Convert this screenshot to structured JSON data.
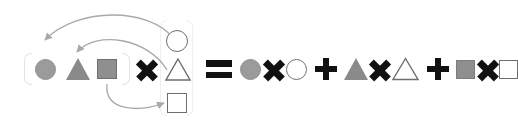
{
  "figure": {
    "background_color": "#ffffff",
    "equation_text": "( ● ▲ ■ ) × ( ○ △ □ ) = ● × ○ + ▲ × △ + ■ × □"
  },
  "palette": {
    "circle_fill": "#9b9b9b",
    "circle_stroke": "#8f8f8f",
    "triangle_fill": "#8a8a8a",
    "square_fill": "#8f8f8f",
    "square_stroke": "#6f6f6f",
    "outline_stroke": "#6e6e6e",
    "operator_black": "#111111",
    "arrow_gray": "#a9a9a9",
    "bracket_gray": "#e3e3e3"
  },
  "left_group": {
    "label": "first-factor-group",
    "bracket": "rounded-bracket",
    "items": [
      {
        "name": "filled-circle",
        "glyph": "●",
        "fill": "#9b9b9b",
        "kind": "filled"
      },
      {
        "name": "filled-triangle",
        "glyph": "▲",
        "fill": "#8a8a8a",
        "kind": "filled"
      },
      {
        "name": "filled-square",
        "glyph": "■",
        "fill": "#8f8f8f",
        "kind": "filled"
      }
    ]
  },
  "multiply_operator": {
    "name": "times",
    "glyph": "×",
    "color": "#111111"
  },
  "right_group": {
    "label": "second-factor-group",
    "bracket": "rounded-bracket",
    "items": [
      {
        "name": "outline-circle",
        "glyph": "○",
        "stroke": "#6e6e6e",
        "kind": "outline"
      },
      {
        "name": "outline-triangle",
        "glyph": "△",
        "stroke": "#6e6e6e",
        "kind": "outline"
      },
      {
        "name": "outline-square",
        "glyph": "□",
        "stroke": "#6e6e6e",
        "kind": "outline"
      }
    ]
  },
  "equals_operator": {
    "name": "equals",
    "glyph": "=",
    "color": "#111111"
  },
  "expansion": {
    "terms": [
      {
        "index": 1,
        "left": {
          "name": "filled-circle",
          "glyph": "●",
          "fill": "#9b9b9b"
        },
        "operator": {
          "name": "times",
          "glyph": "×"
        },
        "right": {
          "name": "outline-circle",
          "glyph": "○",
          "stroke": "#6e6e6e"
        }
      },
      {
        "index": 2,
        "left": {
          "name": "filled-triangle",
          "glyph": "▲",
          "fill": "#8a8a8a"
        },
        "operator": {
          "name": "times",
          "glyph": "×"
        },
        "right": {
          "name": "outline-triangle",
          "glyph": "△",
          "stroke": "#6e6e6e"
        }
      },
      {
        "index": 3,
        "left": {
          "name": "filled-square",
          "glyph": "■",
          "fill": "#8f8f8f"
        },
        "operator": {
          "name": "times",
          "glyph": "×"
        },
        "right": {
          "name": "outline-square",
          "glyph": "□",
          "stroke": "#6e6e6e"
        }
      }
    ],
    "separators": [
      {
        "name": "plus",
        "glyph": "+",
        "color": "#111111"
      },
      {
        "name": "plus",
        "glyph": "+",
        "color": "#111111"
      }
    ]
  },
  "arrows": [
    {
      "name": "arrow-circle-to-outline-circle",
      "from": "filled-circle",
      "to": "outline-circle",
      "color": "#a9a9a9",
      "style": "curved",
      "direction": "right-to-left-arc-over-top"
    },
    {
      "name": "arrow-triangle-to-outline-triangle",
      "from": "filled-triangle",
      "to": "outline-triangle",
      "color": "#a9a9a9",
      "style": "curved",
      "direction": "arc-over-top"
    },
    {
      "name": "arrow-square-to-outline-square",
      "from": "filled-square",
      "to": "outline-square",
      "color": "#a9a9a9",
      "style": "curved",
      "direction": "arc-under-bottom"
    }
  ]
}
